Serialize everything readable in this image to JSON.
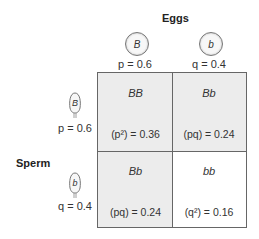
{
  "eggs": {
    "title": "Eggs",
    "alleles": [
      {
        "allele": "B",
        "freq_label": "p = 0.6"
      },
      {
        "allele": "b",
        "freq_label": "q = 0.4"
      }
    ]
  },
  "sperm": {
    "title": "Sperm",
    "alleles": [
      {
        "allele": "B",
        "freq_label": "p = 0.6"
      },
      {
        "allele": "b",
        "freq_label": "q = 0.4"
      }
    ]
  },
  "cells": [
    {
      "genotype": "BB",
      "calc": "(p²) = 0.36",
      "shaded": true
    },
    {
      "genotype": "Bb",
      "calc": "(pq) = 0.24",
      "shaded": true
    },
    {
      "genotype": "Bb",
      "calc": "(pq) = 0.24",
      "shaded": true
    },
    {
      "genotype": "bb",
      "calc": "(q²) = 0.16",
      "shaded": false
    }
  ],
  "colors": {
    "shaded_cell": "#ececec",
    "white_cell": "#ffffff",
    "border": "#666666"
  }
}
